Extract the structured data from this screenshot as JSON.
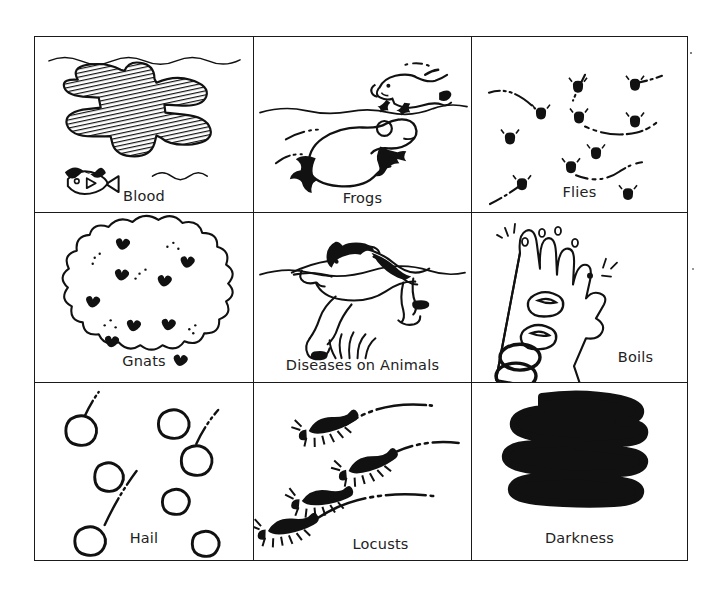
{
  "page": {
    "background_color": "#ffffff",
    "ink_color": "#111111",
    "border_color": "#1a1a1a",
    "grid": {
      "rows": 3,
      "columns": 3
    }
  },
  "cells": [
    {
      "id": "blood",
      "label": "Blood",
      "icon": "blood-hatched-water-icon",
      "row": 1,
      "column": 1,
      "description": "Hatched dark blotch of blood spreading in water with wavy water lines and a dead fish"
    },
    {
      "id": "frogs",
      "label": "Frogs",
      "icon": "leaping-frogs-icon",
      "row": 1,
      "column": 2,
      "description": "Two frogs leaping over a horizon line with motion trails"
    },
    {
      "id": "flies",
      "label": "Flies",
      "icon": "swarming-flies-icon",
      "row": 1,
      "column": 3,
      "description": "Scattered black flies with dashed curved flight paths"
    },
    {
      "id": "gnats",
      "label": "Gnats",
      "icon": "gnat-cloud-icon",
      "row": 2,
      "column": 1,
      "description": "Billowing cloud filled with small dark gnats and specks"
    },
    {
      "id": "diseases-on-animals",
      "label": "Diseases on Animals",
      "icon": "falling-horse-icon",
      "row": 2,
      "column": 2,
      "description": "A horse collapsing on a ground line with tufts of grass"
    },
    {
      "id": "boils",
      "label": "Boils",
      "icon": "boils-on-arm-icon",
      "row": 2,
      "column": 3,
      "description": "An open hand and forearm covered with large boils"
    },
    {
      "id": "hail",
      "label": "Hail",
      "icon": "hailstones-icon",
      "row": 3,
      "column": 1,
      "description": "Round hailstones falling with dashed streak trails"
    },
    {
      "id": "locusts",
      "label": "Locusts",
      "icon": "locust-swarm-icon",
      "row": 3,
      "column": 2,
      "description": "Four dark locusts hopping along arcing dashed trajectories"
    },
    {
      "id": "darkness",
      "label": "Darkness",
      "icon": "darkness-scribble-icon",
      "row": 3,
      "column": 3,
      "description": "A heavy solid black zig-zag scribble filling the frame"
    }
  ]
}
